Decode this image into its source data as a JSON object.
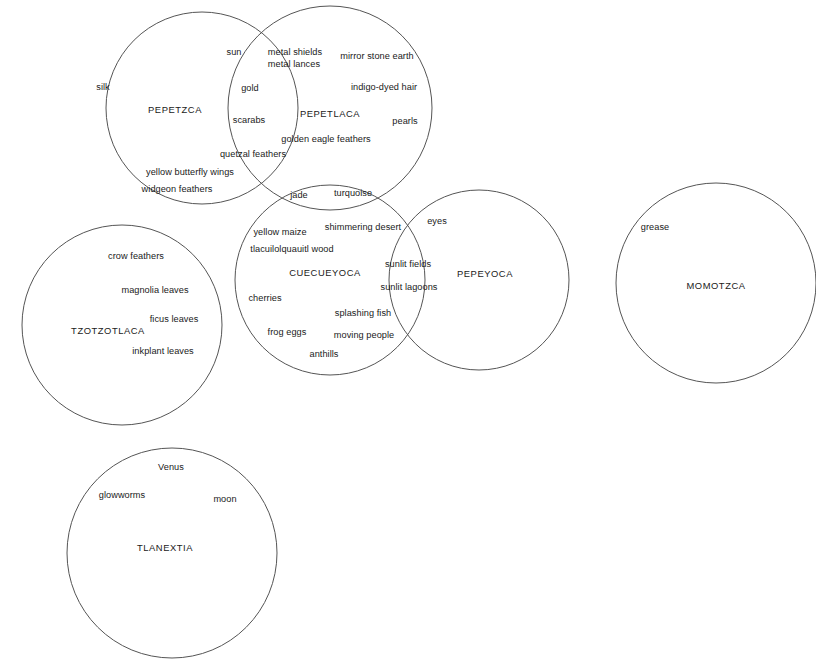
{
  "diagram": {
    "type": "venn",
    "stroke_color": "#555555",
    "text_color": "#1a1a1a",
    "background_color": "#ffffff",
    "sets": [
      {
        "id": "pepetzca",
        "name": "PEPETZCA",
        "cx": 202,
        "cy": 108,
        "r": 96,
        "name_x": 175,
        "name_y": 110
      },
      {
        "id": "pepetlaca",
        "name": "PEPETLACA",
        "cx": 330,
        "cy": 108,
        "r": 102,
        "name_x": 330,
        "name_y": 114
      },
      {
        "id": "cuecueyoca",
        "name": "CUECUEYOCA",
        "cx": 330,
        "cy": 280,
        "r": 95,
        "name_x": 325,
        "name_y": 273
      },
      {
        "id": "pepeyoca",
        "name": "PEPEYOCA",
        "cx": 479,
        "cy": 280,
        "r": 90,
        "name_x": 485,
        "name_y": 274
      },
      {
        "id": "tzotzotlaca",
        "name": "TZOTZOTLACA",
        "cx": 122,
        "cy": 325,
        "r": 100,
        "name_x": 108,
        "name_y": 331
      },
      {
        "id": "momotzca",
        "name": "MOMOTZCA",
        "cx": 716,
        "cy": 283,
        "r": 100,
        "name_x": 716,
        "name_y": 286
      },
      {
        "id": "tlanextia",
        "name": "TLANEXTIA",
        "cx": 172,
        "cy": 553,
        "r": 105,
        "name_x": 165,
        "name_y": 548
      }
    ],
    "items": [
      {
        "text": "silk",
        "x": 103,
        "y": 88,
        "set": "pepetzca"
      },
      {
        "text": "sun",
        "x": 234,
        "y": 53,
        "set": "pepetzca"
      },
      {
        "text": "metal shields\nmetal lances",
        "x": 295,
        "y": 59,
        "set": "pepetlaca",
        "two_line": true
      },
      {
        "text": "mirror stone earth",
        "x": 377,
        "y": 57,
        "set": "pepetlaca"
      },
      {
        "text": "gold",
        "x": 250,
        "y": 89,
        "set": "pepetzca-pepetlaca"
      },
      {
        "text": "indigo-dyed hair",
        "x": 384,
        "y": 88,
        "set": "pepetlaca"
      },
      {
        "text": "scarabs",
        "x": 249,
        "y": 121,
        "set": "pepetzca-pepetlaca"
      },
      {
        "text": "pearls",
        "x": 405,
        "y": 122,
        "set": "pepetlaca"
      },
      {
        "text": "golden eagle feathers",
        "x": 326,
        "y": 140,
        "set": "pepetlaca"
      },
      {
        "text": "quetzal feathers",
        "x": 253,
        "y": 155,
        "set": "pepetzca-pepetlaca"
      },
      {
        "text": "yellow butterfly wings",
        "x": 190,
        "y": 173,
        "set": "pepetzca"
      },
      {
        "text": "widgeon feathers",
        "x": 177,
        "y": 190,
        "set": "pepetzca"
      },
      {
        "text": "jade",
        "x": 299,
        "y": 196,
        "set": "pepetlaca-cuecueyoca"
      },
      {
        "text": "turquoise",
        "x": 353,
        "y": 194,
        "set": "pepetlaca-cuecueyoca"
      },
      {
        "text": "shimmering desert",
        "x": 363,
        "y": 228,
        "set": "cuecueyoca"
      },
      {
        "text": "eyes",
        "x": 437,
        "y": 222,
        "set": "pepeyoca"
      },
      {
        "text": "yellow maize",
        "x": 280,
        "y": 233,
        "set": "cuecueyoca"
      },
      {
        "text": "tlacuilolquauitl wood",
        "x": 292,
        "y": 250,
        "set": "cuecueyoca"
      },
      {
        "text": "crow feathers",
        "x": 136,
        "y": 257,
        "set": "tzotzotlaca"
      },
      {
        "text": "grease",
        "x": 655,
        "y": 228,
        "set": "momotzca"
      },
      {
        "text": "sunlit fields",
        "x": 408,
        "y": 265,
        "set": "cuecueyoca-pepeyoca"
      },
      {
        "text": "magnolia leaves",
        "x": 155,
        "y": 291,
        "set": "tzotzotlaca"
      },
      {
        "text": "sunlit lagoons",
        "x": 409,
        "y": 288,
        "set": "cuecueyoca-pepeyoca"
      },
      {
        "text": "cherries",
        "x": 265,
        "y": 299,
        "set": "cuecueyoca"
      },
      {
        "text": "ficus leaves",
        "x": 174,
        "y": 320,
        "set": "tzotzotlaca"
      },
      {
        "text": "splashing fish",
        "x": 363,
        "y": 314,
        "set": "cuecueyoca"
      },
      {
        "text": "frog eggs",
        "x": 287,
        "y": 333,
        "set": "cuecueyoca"
      },
      {
        "text": "moving people",
        "x": 364,
        "y": 336,
        "set": "cuecueyoca"
      },
      {
        "text": "inkplant leaves",
        "x": 163,
        "y": 352,
        "set": "tzotzotlaca"
      },
      {
        "text": "anthills",
        "x": 324,
        "y": 355,
        "set": "cuecueyoca"
      },
      {
        "text": "Venus",
        "x": 171,
        "y": 468,
        "set": "tlanextia"
      },
      {
        "text": "glowworms",
        "x": 122,
        "y": 496,
        "set": "tlanextia"
      },
      {
        "text": "moon",
        "x": 225,
        "y": 500,
        "set": "tlanextia"
      }
    ]
  }
}
